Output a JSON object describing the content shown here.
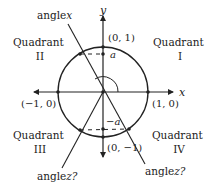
{
  "axes": {
    "x_label": "x",
    "y_label": "y"
  },
  "points": {
    "top": "(0, 1)",
    "bottom": "(0, −1)",
    "left": "(−1, 0)",
    "right": "(1, 0)"
  },
  "heights": {
    "positive": "a",
    "negative": "−a"
  },
  "quadrants": {
    "q1": {
      "word": "Quadrant",
      "num": "I"
    },
    "q2": {
      "word": "Quadrant",
      "num": "II"
    },
    "q3": {
      "word": "Quadrant",
      "num": "III"
    },
    "q4": {
      "word": "Quadrant",
      "num": "IV"
    }
  },
  "angles": {
    "x": {
      "word": "angle",
      "var": "x"
    },
    "z_left": {
      "word": "angle",
      "var": "z?"
    },
    "z_right": {
      "word": "angle",
      "var": "z?"
    }
  },
  "colors": {
    "ink": "#222222",
    "background": "#ffffff"
  }
}
